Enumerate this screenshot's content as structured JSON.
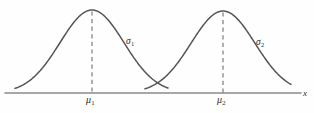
{
  "figure": {
    "title": "",
    "background_color": "#fefefe",
    "curve_color": "#55555a",
    "axis_color": "#8a8a8f",
    "dash_color": "#6e6e73"
  },
  "labels": {
    "sigma1": {
      "symbol": "σ",
      "subscript": "1"
    },
    "sigma2": {
      "symbol": "σ",
      "subscript": "2"
    },
    "mu1": {
      "symbol": "μ",
      "subscript": "1"
    },
    "mu2": {
      "symbol": "μ",
      "subscript": "2"
    },
    "x_axis": "x"
  },
  "chart_data": {
    "type": "line",
    "title": "",
    "subtitle": "",
    "xlabel": "x",
    "ylabel": "",
    "grid": false,
    "legend": "none",
    "axis": {
      "x_start_px": 5,
      "x_end_px": 301,
      "baseline_y_px": 93,
      "arrow": false,
      "ticks": [],
      "tick_labels": [
        "μ₁",
        "μ₂"
      ]
    },
    "annotations": [
      {
        "text": "σ₁",
        "x_px": 126,
        "y_px": 37,
        "describes": "spread of first normal curve"
      },
      {
        "text": "σ₂",
        "x_px": 256,
        "y_px": 38,
        "describes": "spread of second normal curve"
      },
      {
        "text": "μ₁",
        "x_px": 86,
        "y_px": 95,
        "describes": "mean of first normal curve"
      },
      {
        "text": "μ₂",
        "x_px": 217,
        "y_px": 95,
        "describes": "mean of second normal curve"
      },
      {
        "text": "x",
        "x_px": 303,
        "y_px": 89,
        "describes": "horizontal axis variable"
      }
    ],
    "series": [
      {
        "name": "normal-curve-1",
        "distribution": "normal",
        "mean_px": 92,
        "sigma_px": 32,
        "peak_y_px": 10,
        "baseline_y_px": 93,
        "x_domain_px": [
          15,
          168
        ],
        "dashed_mean_line": true
      },
      {
        "name": "normal-curve-2",
        "distribution": "normal",
        "mean_px": 223,
        "sigma_px": 32,
        "peak_y_px": 11,
        "baseline_y_px": 93,
        "x_domain_px": [
          145,
          291
        ],
        "dashed_mean_line": true
      }
    ],
    "intersection_px": {
      "x": 157,
      "y": 81
    }
  }
}
